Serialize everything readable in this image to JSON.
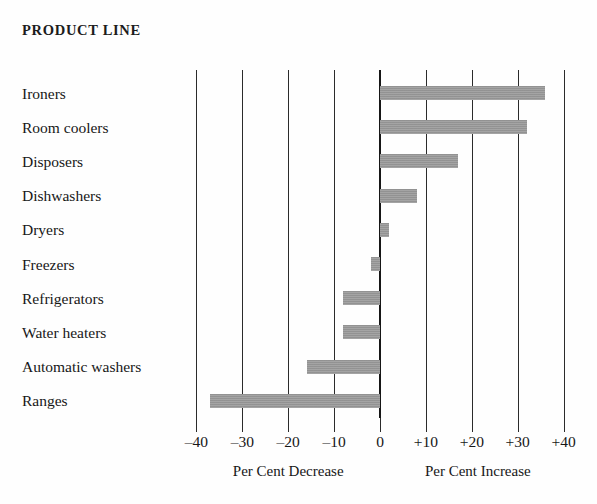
{
  "title": "PRODUCT LINE",
  "axis": {
    "tick_labels": [
      "–40",
      "–30",
      "–20",
      "–10",
      "0",
      "+10",
      "+20",
      "+30",
      "+40"
    ],
    "tick_values": [
      -40,
      -30,
      -20,
      -10,
      0,
      10,
      20,
      30,
      40
    ],
    "caption_left": "Per Cent Decrease",
    "caption_right": "Per Cent Increase"
  },
  "style": {
    "bar_color": "#9a9a9a",
    "grid_color": "#2b2b2b",
    "zero_line_color": "#161616",
    "background": "#fefefe",
    "text_color": "#171717"
  },
  "chart_data": {
    "type": "bar",
    "orientation": "horizontal",
    "title": "PRODUCT LINE",
    "xlabel": "Per Cent Decrease / Per Cent Increase",
    "ylabel": "Product Line",
    "xlim": [
      -40,
      40
    ],
    "xticks": [
      -40,
      -30,
      -20,
      -10,
      0,
      10,
      20,
      30,
      40
    ],
    "grid": true,
    "legend": false,
    "categories": [
      "Ironers",
      "Room coolers",
      "Disposers",
      "Dishwashers",
      "Dryers",
      "Freezers",
      "Refrigerators",
      "Water heaters",
      "Automatic washers",
      "Ranges"
    ],
    "values": [
      36,
      32,
      17,
      8,
      2,
      -2,
      -8,
      -8,
      -16,
      -37
    ],
    "units": "per cent change"
  }
}
